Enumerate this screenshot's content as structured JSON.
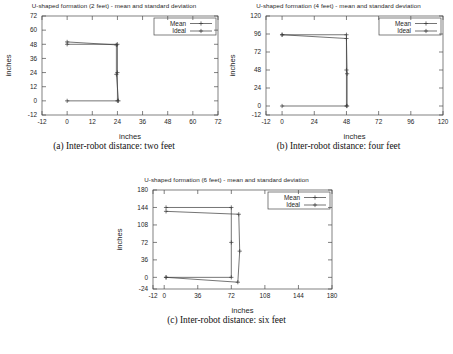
{
  "figure": {
    "panels": [
      {
        "id": "a",
        "title": "U-shaped formation (2 feet) - mean and standard deviation",
        "caption": "(a) Inter-robot distance: two feet",
        "chart_data": {
          "type": "line",
          "title": "U-shaped formation (2 feet) - mean and standard deviation",
          "xlabel": "inches",
          "ylabel": "inches",
          "xlim": [
            -12,
            72
          ],
          "ylim": [
            -12,
            72
          ],
          "xticks": [
            -12,
            0,
            12,
            24,
            36,
            48,
            60,
            72
          ],
          "yticks": [
            -12,
            0,
            12,
            24,
            36,
            48,
            60,
            72
          ],
          "grid": false,
          "legend_position": "top-right",
          "series": [
            {
              "name": "Mean",
              "points": [
                [
                  0,
                  50
                ],
                [
                  23.5,
                  47.5
                ],
                [
                  23.5,
                  22.5
                ],
                [
                  24.5,
                  0
                ]
              ]
            },
            {
              "name": "Ideal",
              "points": [
                [
                  0,
                  48
                ],
                [
                  24,
                  48
                ],
                [
                  24,
                  24
                ],
                [
                  24,
                  0
                ],
                [
                  0,
                  0
                ]
              ]
            }
          ]
        }
      },
      {
        "id": "b",
        "title": "U-shaped formation (4 feet) - mean and standard deviation",
        "caption": "(b) Inter-robot distance: four feet",
        "chart_data": {
          "type": "line",
          "title": "U-shaped formation (4 feet) - mean and standard deviation",
          "xlabel": "inches",
          "ylabel": "inches",
          "xlim": [
            -12,
            120
          ],
          "ylim": [
            -12,
            120
          ],
          "xticks": [
            -12,
            0,
            24,
            48,
            72,
            96,
            120
          ],
          "yticks": [
            -12,
            0,
            24,
            48,
            72,
            96,
            120
          ],
          "grid": false,
          "legend_position": "top-right",
          "series": [
            {
              "name": "Mean",
              "points": [
                [
                  0,
                  95
                ],
                [
                  48,
                  90
                ],
                [
                  48.5,
                  43
                ],
                [
                  48.5,
                  0
                ]
              ]
            },
            {
              "name": "Ideal",
              "points": [
                [
                  0,
                  95
                ],
                [
                  48,
                  95
                ],
                [
                  48,
                  48
                ],
                [
                  48,
                  0
                ],
                [
                  0,
                  0
                ]
              ]
            }
          ]
        }
      },
      {
        "id": "c",
        "title": "U-shaped formation (6 feet) - mean and standard deviation",
        "caption": "(c) Inter-robot distance: six feet",
        "chart_data": {
          "type": "line",
          "title": "U-shaped formation (6 feet) - mean and standard deviation",
          "xlabel": "inches",
          "ylabel": "inches",
          "xlim": [
            -12,
            180
          ],
          "ylim": [
            -24,
            180
          ],
          "xticks": [
            -12,
            0,
            36,
            72,
            108,
            144,
            180
          ],
          "yticks": [
            -24,
            0,
            36,
            72,
            108,
            144,
            180
          ],
          "grid": false,
          "legend_position": "top-right",
          "series": [
            {
              "name": "Mean",
              "points": [
                [
                  2,
                  136
                ],
                [
                  80,
                  130
                ],
                [
                  81,
                  54
                ],
                [
                  79,
                  -10
                ],
                [
                  2,
                  0
                ]
              ]
            },
            {
              "name": "Ideal",
              "points": [
                [
                  2,
                  144
                ],
                [
                  72,
                  144
                ],
                [
                  72,
                  72
                ],
                [
                  72,
                  0
                ],
                [
                  2,
                  0
                ]
              ]
            }
          ]
        }
      }
    ],
    "legend_labels": [
      "Mean",
      "Ideal"
    ]
  }
}
